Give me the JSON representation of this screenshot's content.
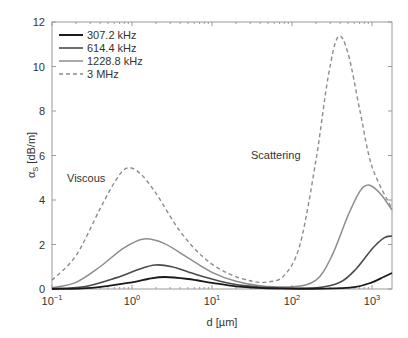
{
  "chart_data": {
    "type": "line",
    "title": "",
    "xlabel": "d [µm]",
    "ylabel": "α_S [dB/m]",
    "ylabel_main": "α",
    "ylabel_sub": "S",
    "ylabel_unit": " [dB/m]",
    "xscale": "log",
    "xlim": [
      0.1,
      1778
    ],
    "ylim": [
      0,
      12
    ],
    "grid": false,
    "legend_position": "upper left",
    "yticks": [
      0,
      2,
      4,
      6,
      8,
      10,
      12
    ],
    "xticks": [
      {
        "base": "10",
        "exp": "−1",
        "log": -1
      },
      {
        "base": "10",
        "exp": "0",
        "log": 0
      },
      {
        "base": "10",
        "exp": "1",
        "log": 1
      },
      {
        "base": "10",
        "exp": "2",
        "log": 2
      },
      {
        "base": "10",
        "exp": "3",
        "log": 3
      }
    ],
    "annotations": [
      {
        "text": "Viscous",
        "log_d": -0.82,
        "y": 4.95
      },
      {
        "text": "Scattering",
        "log_d": 1.49,
        "y": 6.03
      }
    ],
    "series": [
      {
        "name": "307.2 kHz",
        "color": "#1a1a1a",
        "width": 1.8,
        "dash": "",
        "points": [
          [
            -1,
            0.0
          ],
          [
            -0.5,
            0.05
          ],
          [
            0,
            0.3
          ],
          [
            0.2,
            0.45
          ],
          [
            0.41,
            0.54
          ],
          [
            0.7,
            0.45
          ],
          [
            1.0,
            0.28
          ],
          [
            1.3,
            0.12
          ],
          [
            1.7,
            0.03
          ],
          [
            2.4,
            0.02
          ],
          [
            2.8,
            0.1
          ],
          [
            3.0,
            0.3
          ],
          [
            3.15,
            0.55
          ],
          [
            3.25,
            0.72
          ]
        ]
      },
      {
        "name": "614.4 kHz",
        "color": "#4a4a4a",
        "width": 1.6,
        "dash": "",
        "points": [
          [
            -1,
            0.02
          ],
          [
            -0.6,
            0.1
          ],
          [
            -0.2,
            0.5
          ],
          [
            0.1,
            0.9
          ],
          [
            0.29,
            1.08
          ],
          [
            0.5,
            1.0
          ],
          [
            0.8,
            0.65
          ],
          [
            1.1,
            0.35
          ],
          [
            1.4,
            0.15
          ],
          [
            1.8,
            0.05
          ],
          [
            2.3,
            0.05
          ],
          [
            2.6,
            0.3
          ],
          [
            2.8,
            0.9
          ],
          [
            3.0,
            1.8
          ],
          [
            3.15,
            2.3
          ],
          [
            3.25,
            2.38
          ]
        ]
      },
      {
        "name": "1228.8 kHz",
        "color": "#8c8c8c",
        "width": 1.5,
        "dash": "",
        "points": [
          [
            -1,
            0.05
          ],
          [
            -0.7,
            0.3
          ],
          [
            -0.4,
            1.0
          ],
          [
            -0.1,
            1.85
          ],
          [
            0.15,
            2.25
          ],
          [
            0.4,
            2.05
          ],
          [
            0.7,
            1.4
          ],
          [
            1.0,
            0.75
          ],
          [
            1.3,
            0.35
          ],
          [
            1.6,
            0.15
          ],
          [
            2.0,
            0.1
          ],
          [
            2.3,
            0.4
          ],
          [
            2.5,
            1.5
          ],
          [
            2.7,
            3.3
          ],
          [
            2.85,
            4.4
          ],
          [
            2.96,
            4.67
          ],
          [
            3.1,
            4.3
          ],
          [
            3.25,
            3.55
          ]
        ]
      },
      {
        "name": "3 MHz",
        "color": "#8c8c8c",
        "width": 1.4,
        "dash": "4,3",
        "points": [
          [
            -1,
            0.4
          ],
          [
            -0.7,
            1.5
          ],
          [
            -0.4,
            3.6
          ],
          [
            -0.2,
            4.9
          ],
          [
            -0.06,
            5.44
          ],
          [
            0.1,
            5.2
          ],
          [
            0.3,
            4.3
          ],
          [
            0.6,
            2.6
          ],
          [
            0.9,
            1.4
          ],
          [
            1.2,
            0.7
          ],
          [
            1.5,
            0.35
          ],
          [
            1.7,
            0.32
          ],
          [
            1.9,
            0.6
          ],
          [
            2.1,
            2.0
          ],
          [
            2.3,
            5.8
          ],
          [
            2.45,
            9.5
          ],
          [
            2.575,
            11.33
          ],
          [
            2.7,
            10.6
          ],
          [
            2.85,
            8.0
          ],
          [
            3.0,
            5.5
          ],
          [
            3.25,
            3.6
          ]
        ]
      }
    ]
  },
  "legend": {
    "items": [
      {
        "label": "307.2 kHz"
      },
      {
        "label": "614.4 kHz"
      },
      {
        "label": "1228.8 kHz"
      },
      {
        "label": "3 MHz"
      }
    ]
  },
  "axes": {
    "xlabel": "d [µm]"
  },
  "annotations": {
    "viscous": "Viscous",
    "scattering": "Scattering"
  }
}
